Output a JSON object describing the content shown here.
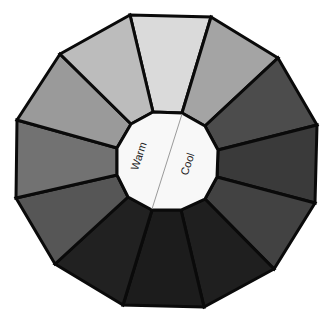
{
  "diagram": {
    "type": "color-wheel",
    "hub_labels": {
      "left": "Warm",
      "right": "Cool"
    },
    "segments": [
      {
        "position": 1,
        "fill": "#dadada"
      },
      {
        "position": 2,
        "fill": "#a4a4a4"
      },
      {
        "position": 3,
        "fill": "#4c4c4c"
      },
      {
        "position": 4,
        "fill": "#3a3a3a"
      },
      {
        "position": 5,
        "fill": "#424242"
      },
      {
        "position": 6,
        "fill": "#1f1f1f"
      },
      {
        "position": 7,
        "fill": "#1c1c1c"
      },
      {
        "position": 8,
        "fill": "#212121"
      },
      {
        "position": 9,
        "fill": "#565656"
      },
      {
        "position": 10,
        "fill": "#727272"
      },
      {
        "position": 11,
        "fill": "#9a9a9a"
      },
      {
        "position": 12,
        "fill": "#bcbcbc"
      }
    ]
  }
}
